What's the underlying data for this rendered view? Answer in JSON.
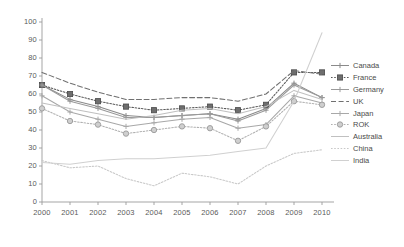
{
  "chart_data": {
    "type": "line",
    "title": "",
    "xlabel": "",
    "ylabel": "",
    "categories": [
      "2000",
      "2001",
      "2002",
      "2003",
      "2004",
      "2005",
      "2006",
      "2007",
      "2008",
      "2009",
      "2010"
    ],
    "x": [
      2000,
      2001,
      2002,
      2003,
      2004,
      2005,
      2006,
      2007,
      2008,
      2009,
      2010
    ],
    "ylim": [
      0,
      100
    ],
    "xlim": [
      2000,
      2010
    ],
    "yticks": [
      0,
      10,
      20,
      30,
      40,
      50,
      60,
      70,
      80,
      90,
      100
    ],
    "grid": false,
    "legend_position": "right",
    "series": [
      {
        "name": "Canada",
        "color": "#8a8a8a",
        "style": "solid",
        "marker": "plus",
        "values": [
          65,
          57,
          53,
          48,
          47,
          48,
          49,
          46,
          52,
          66,
          58
        ]
      },
      {
        "name": "France",
        "color": "#5a5a5a",
        "style": "dotted",
        "marker": "square",
        "values": [
          65,
          60,
          56,
          53,
          51,
          52,
          53,
          51,
          54,
          72,
          72
        ]
      },
      {
        "name": "Germany",
        "color": "#9a9a9a",
        "style": "solid",
        "marker": "plus",
        "values": [
          65,
          56,
          52,
          47,
          47,
          48,
          49,
          45,
          51,
          65,
          58
        ]
      },
      {
        "name": "UK",
        "color": "#707070",
        "style": "dashed",
        "marker": "none",
        "values": [
          72,
          66,
          61,
          57,
          57,
          58,
          58,
          56,
          60,
          73,
          71
        ]
      },
      {
        "name": "Japan",
        "color": "#a8a8a8",
        "style": "solid",
        "marker": "plus",
        "values": [
          59,
          50,
          46,
          42,
          44,
          46,
          47,
          41,
          43,
          59,
          55
        ]
      },
      {
        "name": "ROK",
        "color": "#b0b0b0",
        "style": "dotted",
        "marker": "circle",
        "values": [
          52,
          45,
          43,
          38,
          40,
          42,
          41,
          34,
          42,
          56,
          54
        ]
      },
      {
        "name": "Australia",
        "color": "#c0c0c0",
        "style": "solid",
        "marker": "none",
        "values": [
          55,
          52,
          49,
          46,
          48,
          51,
          52,
          49,
          53,
          62,
          57
        ]
      },
      {
        "name": "China",
        "color": "#c8c8c8",
        "style": "dotted",
        "marker": "none",
        "values": [
          23,
          19,
          20,
          13,
          9,
          16,
          14,
          10,
          20,
          27,
          29
        ]
      },
      {
        "name": "India",
        "color": "#d0d0d0",
        "style": "solid",
        "marker": "none",
        "values": [
          22,
          21,
          23,
          24,
          24,
          25,
          26,
          28,
          30,
          56,
          94
        ]
      }
    ]
  }
}
